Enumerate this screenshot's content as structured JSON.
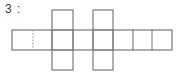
{
  "diagram": {
    "label": "3 :",
    "title": "3 :",
    "kind": "box-net",
    "colors": {
      "stroke": "#7a7a7a",
      "stroke_dark": "#6b6b6b",
      "fill": "#ffffff",
      "background": "#ffffff",
      "label_text": "#3a3a3a",
      "dotted": "#9a9a9a"
    },
    "stroke_width": 1.2,
    "geometry": {
      "strip": {
        "x1": 12,
        "y1": 30,
        "x2": 172,
        "y2": 50
      },
      "vertical_grid_x": [
        12,
        33,
        52,
        73,
        93,
        113,
        133,
        152,
        172
      ],
      "columns": [
        {
          "x1": 52,
          "y1": 10,
          "x2": 73,
          "y2": 70
        },
        {
          "x1": 93,
          "y1": 10,
          "x2": 113,
          "y2": 70
        }
      ],
      "dotted_divider_x": 33,
      "solid_divider_x": [
        52,
        73,
        93,
        113,
        133,
        152
      ]
    },
    "cells": {
      "strip_count": 8,
      "column_count": 2,
      "column_cells_each": 2,
      "total_faces": 8
    }
  }
}
